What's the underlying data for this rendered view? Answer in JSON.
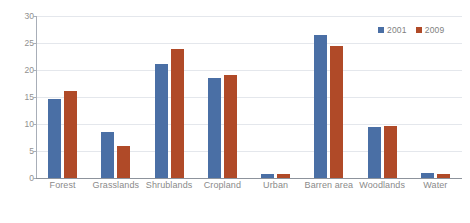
{
  "chart_data": {
    "type": "bar",
    "title": "",
    "xlabel": "",
    "ylabel": "",
    "categories": [
      "Forest",
      "Grasslands",
      "Shrublands",
      "Cropland",
      "Urban",
      "Barren area",
      "Woodlands",
      "Water"
    ],
    "series": [
      {
        "name": "2001",
        "color": "#4a6fa5",
        "values": [
          14.6,
          8.6,
          21.2,
          18.6,
          0.8,
          26.4,
          9.4,
          0.9
        ]
      },
      {
        "name": "2009",
        "color": "#b04a28",
        "values": [
          16.2,
          6.0,
          23.9,
          19.0,
          0.7,
          24.4,
          9.7,
          0.7
        ]
      }
    ],
    "ylim": [
      0,
      30
    ],
    "yticks": [
      0,
      5,
      10,
      15,
      20,
      25,
      30
    ],
    "ytick_labels": [
      "0",
      "5",
      "10",
      "15",
      "20",
      "25",
      "30"
    ],
    "grid": true,
    "legend_position": "top-right"
  },
  "legend": {
    "items": [
      {
        "label": "2001",
        "color": "#4a6fa5"
      },
      {
        "label": "2009",
        "color": "#b04a28"
      }
    ]
  },
  "colors": {
    "series_2001": "#4a6fa5",
    "series_2009": "#b04a28",
    "gridline": "#e4e7ec",
    "axis": "#a8aeb8",
    "tick_text": "#909090",
    "background": "#ffffff"
  }
}
